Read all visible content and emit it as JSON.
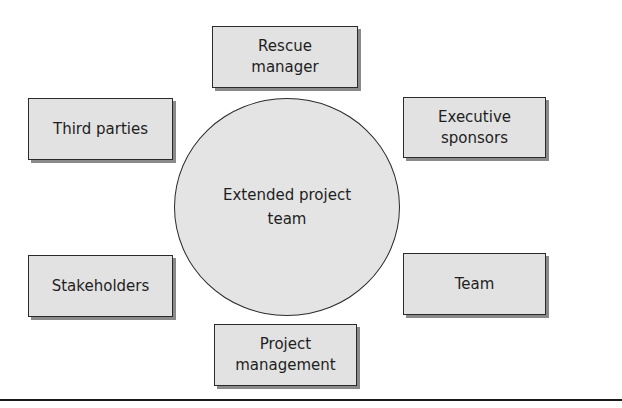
{
  "diagram": {
    "center": {
      "label": "Extended project\nteam"
    },
    "nodes": [
      {
        "id": "rescue-manager",
        "label": "Rescue\nmanager",
        "position": "top"
      },
      {
        "id": "executive-sponsors",
        "label": "Executive\nsponsors",
        "position": "upper-right"
      },
      {
        "id": "team",
        "label": "Team",
        "position": "lower-right"
      },
      {
        "id": "project-management",
        "label": "Project\nmanagement",
        "position": "bottom"
      },
      {
        "id": "stakeholders",
        "label": "Stakeholders",
        "position": "lower-left"
      },
      {
        "id": "third-parties",
        "label": "Third parties",
        "position": "upper-left"
      }
    ],
    "colors": {
      "box_fill": "#e2e2e2",
      "circle_fill": "#e4e4e4",
      "stroke": "#2b2b2b",
      "shadow": "#8a8a8a"
    }
  }
}
